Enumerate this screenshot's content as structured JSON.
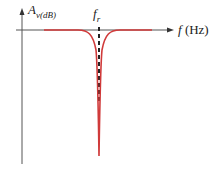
{
  "diagram": {
    "y_axis": {
      "symbol": "A",
      "subscript": "v(dB)"
    },
    "x_axis": {
      "symbol": "f",
      "unit": "(Hz)"
    },
    "marker": {
      "symbol": "f",
      "subscript": "r"
    },
    "colors": {
      "axes": "#555555",
      "curve": "#d03a3a",
      "marker": "#222222"
    }
  }
}
